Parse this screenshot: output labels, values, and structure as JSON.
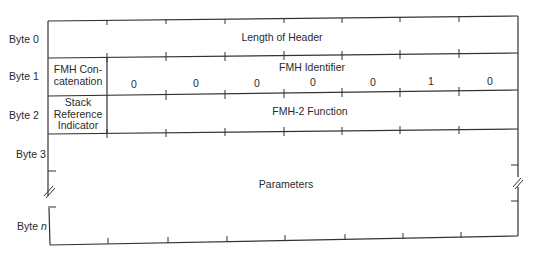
{
  "diagram": {
    "type": "byte-field-layout",
    "rows": [
      {
        "byte_label": "Byte 0",
        "fields": [
          {
            "name": "Length of Header",
            "span_bits": 8
          }
        ]
      },
      {
        "byte_label": "Byte 1",
        "fields": [
          {
            "name": "FMH Con-\ncatenation",
            "span_bits": 1
          },
          {
            "name": "FMH Identifier",
            "span_bits": 7,
            "bit_values": [
              "0",
              "0",
              "0",
              "0",
              "0",
              "1",
              "0"
            ]
          }
        ]
      },
      {
        "byte_label": "Byte 2",
        "fields": [
          {
            "name": "Stack\nReference\nIndicator",
            "span_bits": 1
          },
          {
            "name": "FMH-2 Function",
            "span_bits": 7
          }
        ]
      },
      {
        "byte_label": "Byte 3",
        "fields": [
          {
            "name": "Parameters",
            "span_bits": 8,
            "spans_to": "Byte n"
          }
        ]
      }
    ],
    "byte_labels": {
      "b0": "Byte 0",
      "b1": "Byte 1",
      "b2": "Byte 2",
      "b3": "Byte 3",
      "bn_prefix": "Byte ",
      "bn_var": "n"
    },
    "fields": {
      "length_of_header": "Length of Header",
      "fmh_concat_line1": "FMH Con-",
      "fmh_concat_line2": "catenation",
      "fmh_identifier": "FMH Identifier",
      "stack_ref_line1": "Stack",
      "stack_ref_line2": "Reference",
      "stack_ref_line3": "Indicator",
      "fmh2_function": "FMH-2 Function",
      "parameters": "Parameters"
    },
    "fmh_identifier_bits": [
      "0",
      "0",
      "0",
      "0",
      "0",
      "1",
      "0"
    ],
    "break_marker": "//",
    "line_color": "#333333"
  }
}
